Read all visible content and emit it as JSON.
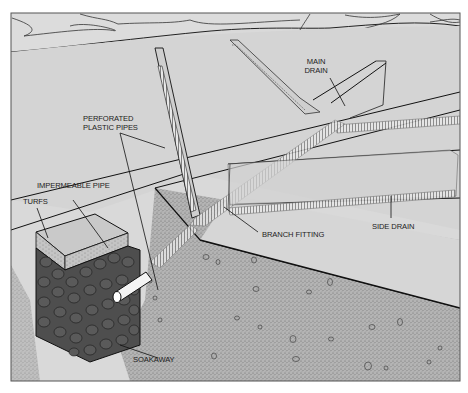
{
  "figure": {
    "type": "cutaway-illustration",
    "colors": {
      "background": "#d9d9d9",
      "sky": "#dedede",
      "frame": "#555555",
      "line": "#1a1a1a",
      "soil": "#a8a8a8",
      "stones": "#4a4a4a",
      "turf": "#bdbdbd",
      "pipe": "#f2f2f2"
    }
  },
  "labels": {
    "main_drain_line1": "MAIN",
    "main_drain_line2": "DRAIN",
    "perforated_line1": "PERFORATED",
    "perforated_line2": "PLASTIC PIPES",
    "impermeable_pipe": "IMPERMEABLE PIPE",
    "turfs": "TURFS",
    "branch_fitting": "BRANCH FITTING",
    "side_drain": "SIDE DRAIN",
    "soakaway": "SOAKAWAY"
  }
}
